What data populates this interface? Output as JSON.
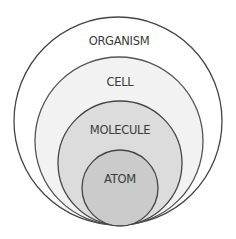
{
  "diagram": {
    "type": "nested-circles",
    "levels": [
      {
        "label": "ORGANISM",
        "fill": "#ffffff",
        "stroke": "#444444"
      },
      {
        "label": "CELL",
        "fill": "#f2f2f2",
        "stroke": "#555555"
      },
      {
        "label": "MOLECULE",
        "fill": "#dcdcdc",
        "stroke": "#444444"
      },
      {
        "label": "ATOM",
        "fill": "#cbcbcb",
        "stroke": "#444444"
      }
    ]
  }
}
